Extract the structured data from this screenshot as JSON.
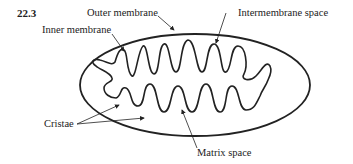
{
  "figure": {
    "number": "22.3",
    "labels": {
      "outer_membrane": "Outer membrane",
      "intermembrane_space": "Intermembrane space",
      "inner_membrane": "Inner membrane",
      "cristae": "Cristae",
      "matrix_space": "Matrix space"
    }
  }
}
